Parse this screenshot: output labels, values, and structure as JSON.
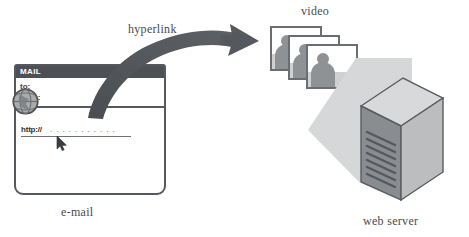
{
  "diagram": {
    "labels": {
      "hyperlink": "hyperlink",
      "video": "video",
      "email": "e-mail",
      "web_server": "web server"
    },
    "colors": {
      "arrow": "#4d5054",
      "window_border": "#55585c",
      "titlebar": "#4d5054",
      "frame_border": "#6a6d71",
      "silhouette": "#8f9295",
      "beam": "#d3d4d5",
      "server_side": "#bcbdbf",
      "server_front": "#8a8d90",
      "server_top": "#d8d9da",
      "background": "#ffffff"
    }
  },
  "mail_window": {
    "titlebar_label": "MAIL",
    "fields": [
      {
        "label": "to:"
      },
      {
        "label": "from:"
      }
    ],
    "body": {
      "link_protocol": "http://",
      "link_dots": ". . . . . . . . . . ."
    },
    "cursor": "mouse-pointer"
  },
  "video": {
    "frame_count": 3,
    "frames": [
      {
        "name": "video-frame-1"
      },
      {
        "name": "video-frame-2"
      },
      {
        "name": "video-frame-3"
      }
    ]
  },
  "web_server": {
    "vent_slot_count": 7,
    "globe_icon": "globe-icon"
  }
}
